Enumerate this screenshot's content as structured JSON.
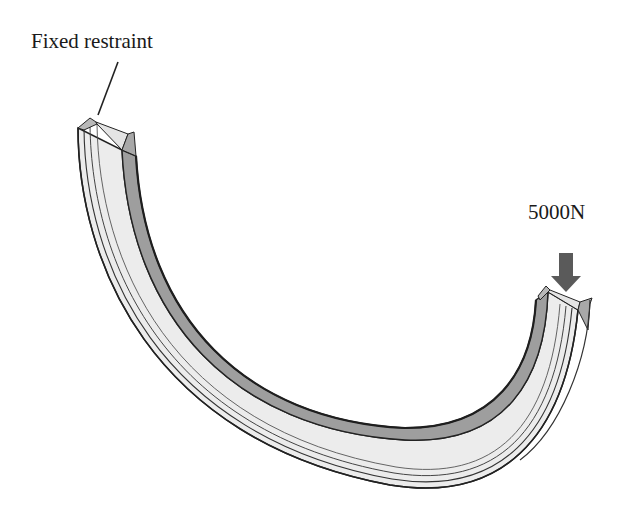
{
  "diagram": {
    "annotations": {
      "fixed_restraint_label": "Fixed restraint",
      "load_label": "5000N"
    },
    "components": [
      {
        "name": "curved-beam",
        "shape": "semicircular arc, I-section (channel shown in perspective)"
      },
      {
        "name": "fixed-end",
        "position": "upper-left end",
        "constraint": "Fixed restraint"
      },
      {
        "name": "loaded-end",
        "position": "right end",
        "load": "5000N",
        "direction": "downward"
      }
    ],
    "colors": {
      "background": "#ffffff",
      "web_face": "#ececec",
      "flange_face": "#9e9e9e",
      "edge_line": "#222222",
      "load_arrow": "#5a5a5a",
      "text": "#1a1a1a"
    }
  }
}
